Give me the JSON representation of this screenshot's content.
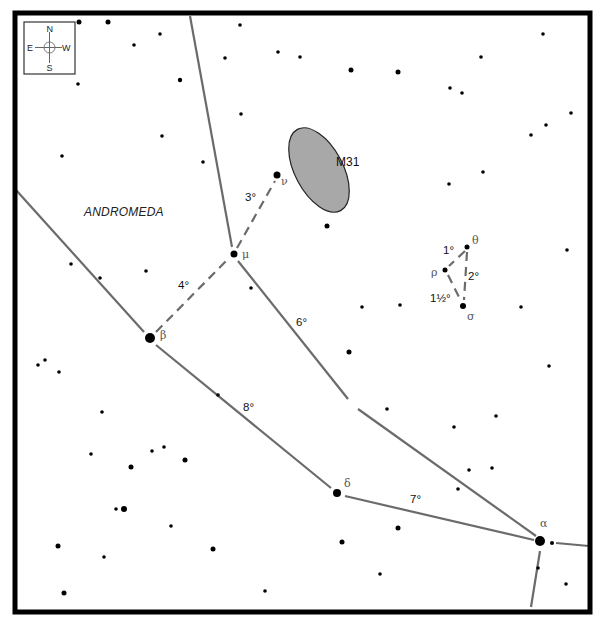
{
  "constellation_label": "ANDROMEDA",
  "compass": {
    "north": "N",
    "south": "S",
    "east": "E",
    "west": "W"
  },
  "target": {
    "label": "M31",
    "cx": 319,
    "cy": 170,
    "rx": 24,
    "ry": 46,
    "rotate": -28,
    "fill": "#a8a8a8"
  },
  "named_stars": [
    {
      "id": "alpha",
      "glyph": "α",
      "x": 540,
      "y": 541,
      "r": 5,
      "lx": 540,
      "ly": 527
    },
    {
      "id": "beta",
      "glyph": "β",
      "x": 150,
      "y": 338,
      "r": 5,
      "lx": 160,
      "ly": 339
    },
    {
      "id": "delta",
      "glyph": "δ",
      "x": 337,
      "y": 493,
      "r": 4,
      "lx": 344,
      "ly": 487
    },
    {
      "id": "mu",
      "glyph": "μ",
      "x": 234,
      "y": 254,
      "r": 3.5,
      "lx": 242,
      "ly": 258
    },
    {
      "id": "nu",
      "glyph": "ν",
      "x": 277,
      "y": 175,
      "r": 3.5,
      "lx": 281,
      "ly": 185
    },
    {
      "id": "theta",
      "glyph": "θ",
      "x": 467,
      "y": 247,
      "r": 2.5,
      "lx": 472,
      "ly": 244
    },
    {
      "id": "rho",
      "glyph": "ρ",
      "x": 445,
      "y": 270,
      "r": 2.5,
      "lx": 431,
      "ly": 276
    },
    {
      "id": "sigma",
      "glyph": "σ",
      "x": 463,
      "y": 306,
      "r": 3,
      "lx": 467,
      "ly": 320
    }
  ],
  "constellation_lines": [
    {
      "x1": 190,
      "y1": 16,
      "x2": 232,
      "y2": 247
    },
    {
      "x1": 238,
      "y1": 261,
      "x2": 348,
      "y2": 399
    },
    {
      "x1": 358,
      "y1": 409,
      "x2": 536,
      "y2": 536
    },
    {
      "x1": 16,
      "y1": 190,
      "x2": 144,
      "y2": 332
    },
    {
      "x1": 156,
      "y1": 345,
      "x2": 331,
      "y2": 488
    },
    {
      "x1": 345,
      "y1": 496,
      "x2": 534,
      "y2": 540
    },
    {
      "x1": 556,
      "y1": 543,
      "x2": 589,
      "y2": 546
    },
    {
      "x1": 540,
      "y1": 551,
      "x2": 531,
      "y2": 607
    }
  ],
  "hop_lines": [
    {
      "x1": 237,
      "y1": 248,
      "x2": 275,
      "y2": 181
    },
    {
      "x1": 156,
      "y1": 332,
      "x2": 229,
      "y2": 258
    },
    {
      "x1": 465,
      "y1": 251,
      "x2": 449,
      "y2": 266
    },
    {
      "x1": 467,
      "y1": 252,
      "x2": 464,
      "y2": 300
    },
    {
      "x1": 448,
      "y1": 275,
      "x2": 461,
      "y2": 301
    }
  ],
  "distance_labels": [
    {
      "text": "3°",
      "x": 245,
      "y": 201
    },
    {
      "text": "4°",
      "x": 178,
      "y": 289
    },
    {
      "text": "6°",
      "x": 296,
      "y": 326
    },
    {
      "text": "8°",
      "x": 243,
      "y": 411
    },
    {
      "text": "7°",
      "x": 410,
      "y": 503
    },
    {
      "text": "1°",
      "x": 443,
      "y": 254
    },
    {
      "text": "2°",
      "x": 468,
      "y": 280
    },
    {
      "text": "1½°",
      "x": 430,
      "y": 302
    }
  ],
  "field_stars": [
    [
      79,
      22,
      2.5
    ],
    [
      108,
      22,
      2.5
    ],
    [
      160,
      34,
      1.8
    ],
    [
      134,
      45,
      1.8
    ],
    [
      180,
      80,
      2.2
    ],
    [
      78,
      84,
      1.8
    ],
    [
      162,
      136,
      1.8
    ],
    [
      62,
      156,
      1.8
    ],
    [
      203,
      162,
      1.8
    ],
    [
      240,
      25,
      1.8
    ],
    [
      225,
      58,
      1.8
    ],
    [
      278,
      52,
      1.8
    ],
    [
      300,
      57,
      1.8
    ],
    [
      241,
      114,
      1.8
    ],
    [
      351,
      70,
      2.5
    ],
    [
      398,
      72,
      2.5
    ],
    [
      450,
      88,
      1.8
    ],
    [
      462,
      93,
      1.8
    ],
    [
      481,
      57,
      1.8
    ],
    [
      543,
      34,
      1.8
    ],
    [
      571,
      113,
      1.8
    ],
    [
      546,
      125,
      1.8
    ],
    [
      531,
      135,
      1.8
    ],
    [
      327,
      226,
      2.5
    ],
    [
      449,
      184,
      1.8
    ],
    [
      483,
      172,
      1.8
    ],
    [
      567,
      250,
      1.8
    ],
    [
      71,
      264,
      1.8
    ],
    [
      100,
      278,
      1.8
    ],
    [
      146,
      271,
      1.8
    ],
    [
      251,
      288,
      1.8
    ],
    [
      362,
      307,
      1.8
    ],
    [
      400,
      305,
      1.8
    ],
    [
      521,
      307,
      1.8
    ],
    [
      38,
      365,
      1.8
    ],
    [
      45,
      360,
      1.8
    ],
    [
      59,
      372,
      1.8
    ],
    [
      102,
      412,
      1.8
    ],
    [
      218,
      395,
      1.8
    ],
    [
      349,
      352,
      2.5
    ],
    [
      549,
      366,
      1.8
    ],
    [
      387,
      409,
      1.8
    ],
    [
      454,
      427,
      1.8
    ],
    [
      496,
      416,
      1.8
    ],
    [
      91,
      454,
      1.8
    ],
    [
      152,
      451,
      1.8
    ],
    [
      164,
      447,
      1.8
    ],
    [
      185,
      460,
      2.5
    ],
    [
      131,
      467,
      2.5
    ],
    [
      469,
      470,
      1.8
    ],
    [
      492,
      468,
      1.8
    ],
    [
      458,
      489,
      1.8
    ],
    [
      398,
      528,
      2.5
    ],
    [
      342,
      542,
      2.5
    ],
    [
      380,
      574,
      1.8
    ],
    [
      116,
      509,
      1.8
    ],
    [
      124,
      509,
      3
    ],
    [
      171,
      526,
      1.8
    ],
    [
      58,
      546,
      2.5
    ],
    [
      104,
      557,
      1.8
    ],
    [
      213,
      549,
      2.5
    ],
    [
      64,
      593,
      2.5
    ],
    [
      265,
      591,
      1.8
    ],
    [
      552,
      543,
      2
    ],
    [
      538,
      568,
      1.8
    ],
    [
      566,
      584,
      1.8
    ]
  ]
}
